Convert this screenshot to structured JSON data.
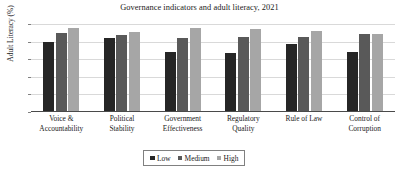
{
  "chart_data": {
    "type": "bar",
    "title": "Governance indicators and adult literacy, 2021",
    "xlabel": "",
    "ylabel": "Adult Literacy (%)",
    "ylim": [
      0,
      100
    ],
    "yticks": [
      0,
      20,
      40,
      60,
      80,
      100
    ],
    "grid": true,
    "legend_position": "bottom",
    "categories": [
      "Voice &\nAccountability",
      "Political\nStability",
      "Government\nEffectiveness",
      "Regulatory\nQuality",
      "Rule of Law",
      "Control of\nCorruption"
    ],
    "category_lines": [
      [
        "Voice &",
        "Accountability"
      ],
      [
        "Political",
        "Stability"
      ],
      [
        "Government",
        "Effectiveness"
      ],
      [
        "Regulatory",
        "Quality"
      ],
      [
        "Rule of Law",
        ""
      ],
      [
        "Control of",
        "Corruption"
      ]
    ],
    "series": [
      {
        "name": "Low",
        "color": "#262626",
        "values": [
          79,
          84,
          68,
          67,
          77,
          68
        ]
      },
      {
        "name": "Medium",
        "color": "#595959",
        "values": [
          90,
          88,
          84,
          85,
          85,
          89
        ]
      },
      {
        "name": "High",
        "color": "#a6a6a6",
        "values": [
          96,
          91,
          96,
          94,
          92,
          89
        ]
      }
    ]
  },
  "legend": {
    "items": [
      {
        "label": "Low",
        "color": "#262626"
      },
      {
        "label": "Medium",
        "color": "#595959"
      },
      {
        "label": "High",
        "color": "#a6a6a6"
      }
    ]
  }
}
